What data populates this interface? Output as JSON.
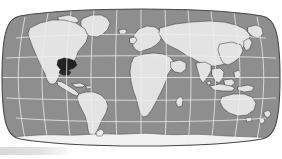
{
  "figure": {
    "kind": "world-map",
    "projection": "Robinson",
    "title": "",
    "caption": "",
    "colors": {
      "background": "#ffffff",
      "ocean": "#8e8e8e",
      "land": "#e3e3e3",
      "land_outline": "#3a3a3a",
      "graticule": "#efefef",
      "frame": "#4a4a4a",
      "highlight": "#1f1f1f",
      "ice": "#f2f2f2",
      "bottom_bar": "#dcdcdc"
    },
    "graticule": {
      "visible": true,
      "meridian_interval_deg": 30,
      "parallel_interval_deg": 30,
      "meridians_deg": [
        -180,
        -150,
        -120,
        -90,
        -60,
        -30,
        0,
        30,
        60,
        90,
        120,
        150,
        180
      ],
      "parallels_deg": [
        -60,
        -30,
        0,
        30,
        60
      ],
      "equator_deg": 0,
      "prime_meridian_deg": 0
    },
    "extent": {
      "lon_min": -180,
      "lon_max": 180,
      "lat_min": -90,
      "lat_max": 90
    },
    "highlight_region": {
      "label": "southeastern united states",
      "approx_center_lon": -86,
      "approx_center_lat": 32,
      "shaded": true
    },
    "labels": [],
    "legend": {
      "visible": false,
      "entries": []
    },
    "scale_bar": {
      "visible": false,
      "text": ""
    },
    "features": [
      "north-america",
      "south-america",
      "greenland",
      "europe",
      "africa",
      "asia",
      "australia",
      "antarctica",
      "madagascar",
      "japan",
      "new-zealand",
      "british-isles",
      "indonesia",
      "iceland"
    ]
  },
  "bottom_bar": {
    "visible": true,
    "text": ""
  }
}
